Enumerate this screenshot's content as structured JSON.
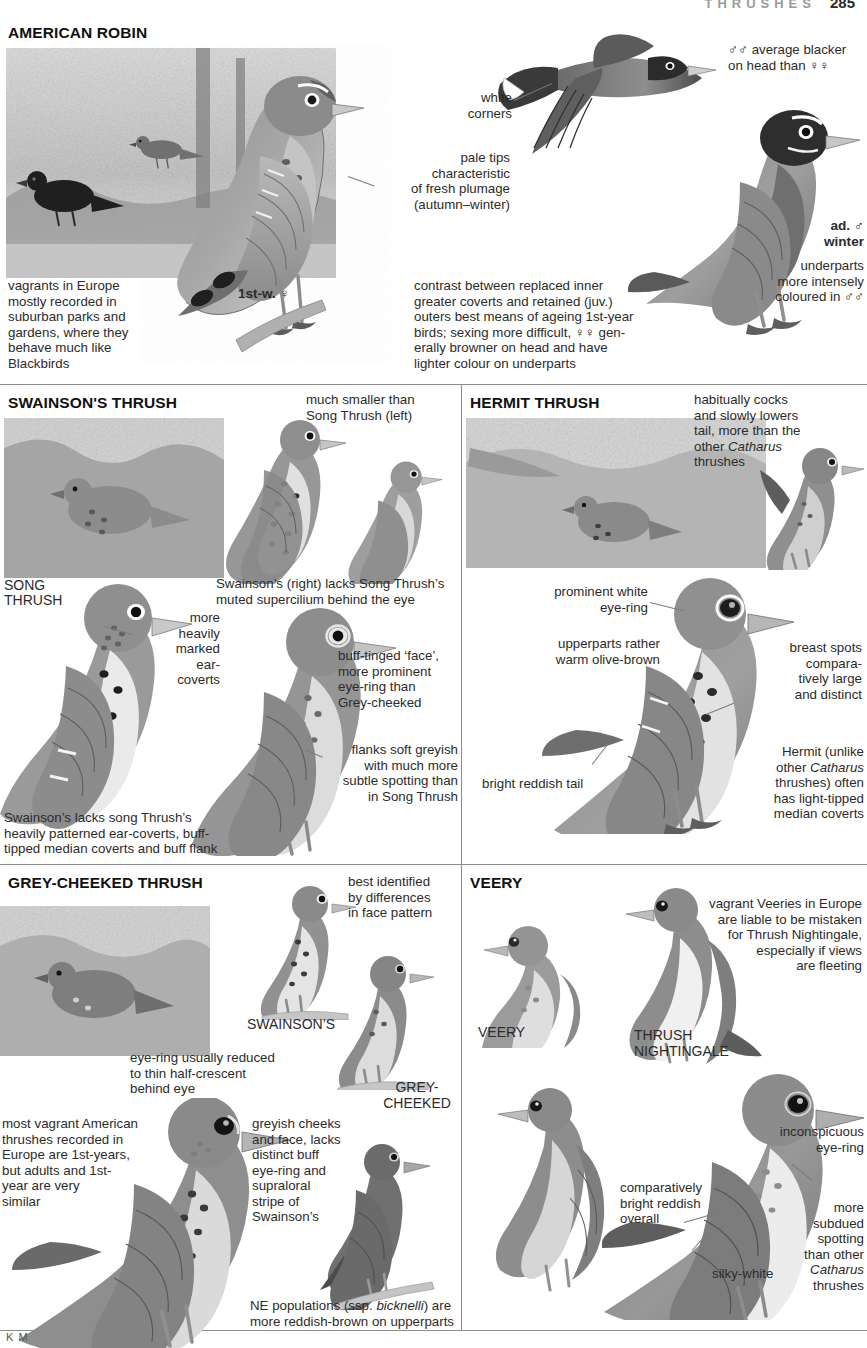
{
  "runhead": {
    "title": "THRUSHES",
    "page": "285"
  },
  "signature": "K M",
  "sections": {
    "robin": {
      "title": "AMERICAN ROBIN",
      "captions": {
        "white_corners": "white\ncorners",
        "males_blacker": "♂♂ average blacker\non head than ♀♀",
        "pale_tips": "pale tips\ncharacteristic\nof fresh plumage\n(autumn–winter)",
        "vagrants": "vagrants in Europe\nmostly recorded in\nsuburban parks and\ngardens, where they\nbehave much like\nBlackbirds",
        "first_winter": "1st-w. ♀",
        "contrast": "contrast between replaced inner\ngreater coverts and retained (juv.)\nouters best means of ageing 1st-year\nbirds; sexing more difficult, ♀♀ gen-\nerally browner on head and have\nlighter colour on underparts",
        "ad_male_winter": "ad. ♂\nwinter",
        "underparts": "underparts\nmore intensely\ncoloured in ♂♂"
      }
    },
    "swainsons": {
      "title": "SWAINSON'S THRUSH",
      "captions": {
        "much_smaller": "much smaller than\nSong Thrush (left)",
        "song_thrush_label": "SONG\nTHRUSH",
        "more_heavily": "more\nheavily\nmarked\near-\ncoverts",
        "lacks_supercilium": "Swainson’s (right) lacks Song Thrush’s\nmuted supercilium behind the eye",
        "buff_tinged": "buff-tinged ‘face’,\nmore prominent\neye-ring than\nGrey-cheeked",
        "flanks": "flanks soft greyish\nwith much more\nsubtle spotting than\nin Song Thrush",
        "bottom": "Swainson’s lacks song Thrush’s\nheavily patterned ear-coverts, buff-\ntipped median coverts and buff flank"
      }
    },
    "hermit": {
      "title": "HERMIT THRUSH",
      "captions": {
        "cocks_tail": "habitually cocks\nand slowly lowers\ntail, more than the\nother ",
        "cocks_tail_italic": "Catharus",
        "cocks_tail_end": "\nthrushes",
        "eye_ring": "prominent white\neye-ring",
        "upperparts": "upperparts rather\nwarm olive-brown",
        "breast_spots": "breast spots\ncompara-\ntively large\nand distinct",
        "reddish_tail": "bright reddish tail",
        "median_coverts": "Hermit (unlike\nother ",
        "median_coverts_italic": "Catharus",
        "median_coverts_end": "\nthrushes) often\nhas light-tipped\nmedian coverts"
      }
    },
    "greycheeked": {
      "title": "GREY-CHEEKED THRUSH",
      "captions": {
        "best_identified": "best identified\nby differences\nin face pattern",
        "swainsons_label": "SWAINSON’S",
        "greycheeked_label": "GREY-\nCHEEKED",
        "eye_ring_reduced": "eye-ring usually reduced\nto thin half-crescent\nbehind eye",
        "most_vagrant": "most vagrant American\nthrushes recorded in\nEurope are 1st-years,\nbut adults and 1st-\nyear are very\nsimilar",
        "greyish_cheeks": "greyish cheeks\nand face, lacks\ndistinct buff\neye-ring and\nsupraloral\nstripe of\nSwainson’s",
        "ne_populations": "NE populations (ssp. ",
        "ne_populations_italic": "bicknelli",
        "ne_populations_end": ") are\nmore reddish-brown on upperparts"
      }
    },
    "veery": {
      "title": "VEERY",
      "captions": {
        "vagrant_veeries": "vagrant Veeries in Europe\nare liable to be mistaken\nfor Thrush Nightingale,\nespecially if views\nare fleeting",
        "veery_label": "VEERY",
        "thrush_nightingale_label": "THRUSH\nNIGHTINGALE",
        "inconspicuous": "inconspicuous\neye-ring",
        "bright_reddish": "comparatively\nbright reddish\noverall",
        "more_subdued": "more\nsubdued\nspotting\nthan other ",
        "more_subdued_italic": "Catharus",
        "more_subdued_end": "\nthrushes",
        "silky_white": "silky-white"
      }
    }
  },
  "colors": {
    "rule": "#8d8d8d",
    "text": "#2b2b2b",
    "heading": "#111111",
    "runhead": "#9a9a9a",
    "leader": "#7b7b7b"
  }
}
